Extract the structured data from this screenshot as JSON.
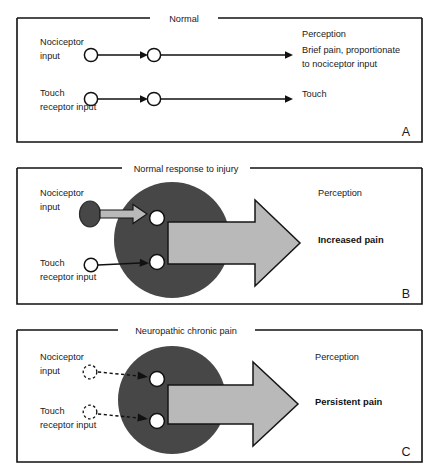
{
  "figure": {
    "panels": [
      {
        "id": "A",
        "letter": "A",
        "title": "Normal",
        "perception_heading": "Perception",
        "rows": [
          {
            "input_label_line1": "Nociceptor",
            "input_label_line2": "input",
            "output_line1": "Brief pain, proportionate",
            "output_line2": "to nociceptor input"
          },
          {
            "input_label_line1": "Touch",
            "input_label_line2": "receptor input",
            "output_line1": "Touch",
            "output_line2": ""
          }
        ]
      },
      {
        "id": "B",
        "letter": "B",
        "title": "Normal response to injury",
        "perception_heading": "Perception",
        "outcome": "Increased pain",
        "rows": [
          {
            "input_label_line1": "Nociceptor",
            "input_label_line2": "input"
          },
          {
            "input_label_line1": "Touch",
            "input_label_line2": "receptor input"
          }
        ]
      },
      {
        "id": "C",
        "letter": "C",
        "title": "Neuropathic chronic pain",
        "perception_heading": "Perception",
        "outcome": "Persistent pain",
        "rows": [
          {
            "input_label_line1": "Nociceptor",
            "input_label_line2": "input"
          },
          {
            "input_label_line1": "Touch",
            "input_label_line2": "receptor input"
          }
        ]
      }
    ]
  },
  "colors": {
    "stroke": "#111111",
    "hub_fill": "#474747",
    "arrow_fill": "#b9b9b9",
    "node_open_fill": "#ffffff",
    "background": "#ffffff"
  }
}
